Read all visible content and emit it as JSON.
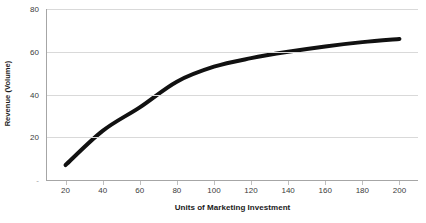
{
  "chart_data": {
    "type": "line",
    "title": "",
    "xlabel": "Units of Marketing Investment",
    "ylabel": "Revenue (Volume)",
    "x": [
      20,
      40,
      60,
      80,
      100,
      120,
      140,
      160,
      180,
      200
    ],
    "values": [
      7,
      23,
      34,
      46,
      53,
      57,
      60,
      62.5,
      64.5,
      66
    ],
    "series": [
      {
        "name": "Revenue (Volume)",
        "values": [
          7,
          23,
          34,
          46,
          53,
          57,
          60,
          62.5,
          64.5,
          66
        ]
      }
    ],
    "xlim": [
      10,
      210
    ],
    "ylim": [
      0,
      80
    ],
    "xticks": [
      "20",
      "40",
      "60",
      "80",
      "100",
      "120",
      "140",
      "160",
      "180",
      "200"
    ],
    "xtick_values": [
      20,
      40,
      60,
      80,
      100,
      120,
      140,
      160,
      180,
      200
    ],
    "yticks": [
      "-",
      "20",
      "40",
      "60",
      "80"
    ],
    "ytick_values": [
      0,
      20,
      40,
      60,
      80
    ],
    "grid": "horizontal",
    "legend": "none",
    "line_color": "#111111",
    "line_width": 4,
    "gridline_color": "#D9D9D9",
    "axis_color": "#A6A6A6",
    "background_color": "#FFFFFF",
    "text_color": "#3B3B3B"
  }
}
